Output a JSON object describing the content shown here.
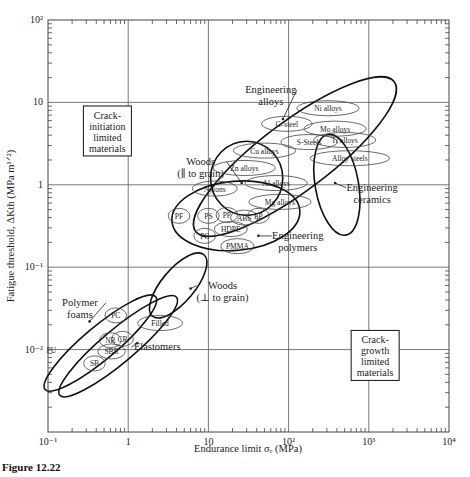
{
  "figure_caption": "Figure 12.22",
  "chart_data": {
    "type": "scatter",
    "title": "",
    "xlabel": "Endurance limit σe (MPa)",
    "ylabel": "Fatigue threshold, ΔKth (MPa m^1/2)",
    "xscale": "log",
    "yscale": "log",
    "xlim": [
      0.1,
      10000
    ],
    "ylim": [
      0.001,
      100
    ],
    "grid": "major decades",
    "x_ticks": [
      {
        "value": 0.1,
        "label": "10⁻¹"
      },
      {
        "value": 1,
        "label": "1"
      },
      {
        "value": 10,
        "label": "10"
      },
      {
        "value": 100,
        "label": "10²"
      },
      {
        "value": 1000,
        "label": "10³"
      },
      {
        "value": 10000,
        "label": "10⁴"
      }
    ],
    "y_ticks": [
      {
        "value": 100,
        "label": "10²"
      },
      {
        "value": 10,
        "label": "10"
      },
      {
        "value": 1,
        "label": "1"
      },
      {
        "value": 0.1,
        "label": "10⁻¹"
      },
      {
        "value": 0.01,
        "label": "10⁻²"
      }
    ],
    "boxed_annotations": [
      {
        "lines": [
          "Crack-",
          "initiation",
          "limited",
          "materials"
        ],
        "x": 0.55,
        "y": 4.5
      },
      {
        "lines": [
          "Crack-",
          "growth",
          "limited",
          "materials"
        ],
        "x": 1200,
        "y": 0.0085
      }
    ],
    "families": [
      {
        "name": "Engineering alloys",
        "label_lines": [
          "Engineering",
          "alloys"
        ],
        "cx": 120,
        "cy": 2.2,
        "rx_dec": 1.55,
        "ry_dec": 0.42,
        "angle": -37,
        "label_x": 60,
        "label_y": 13,
        "pointer": [
          85,
          6.3
        ],
        "bold": true
      },
      {
        "name": "Engineering ceramics",
        "label_lines": [
          "Engineering",
          "ceramics"
        ],
        "cx": 400,
        "cy": 1.0,
        "rx_dec": 0.27,
        "ry_dec": 0.62,
        "angle": -10,
        "label_x": 1100,
        "label_y": 0.85,
        "pointer": [
          380,
          1.05
        ],
        "bold": true
      },
      {
        "name": "Woods (∥ to grain)",
        "label_lines": [
          "Woods",
          "(∥ to grain)"
        ],
        "cx": 30,
        "cy": 1.2,
        "rx_dec": 0.45,
        "ry_dec": 0.45,
        "angle": 0,
        "label_x": 8,
        "label_y": 1.75,
        "pointer": [
          26,
          1.05
        ],
        "bold": true
      },
      {
        "name": "Engineering polymers",
        "label_lines": [
          "Engineering",
          "polymers"
        ],
        "cx": 22,
        "cy": 0.42,
        "rx_dec": 0.8,
        "ry_dec": 0.42,
        "angle": -5,
        "label_x": 130,
        "label_y": 0.22,
        "pointer": [
          42,
          0.24
        ],
        "bold": true
      },
      {
        "name": "Woods (⊥ to grain)",
        "label_lines": [
          "Woods",
          "(⊥ to grain)"
        ],
        "cx": 4.2,
        "cy": 0.06,
        "rx_dec": 0.5,
        "ry_dec": 0.2,
        "angle": -50,
        "label_x": 15,
        "label_y": 0.055,
        "pointer": [
          6,
          0.055
        ],
        "bold": true
      },
      {
        "name": "Polymer foams",
        "label_lines": [
          "Polymer",
          "foams"
        ],
        "cx": 0.45,
        "cy": 0.012,
        "rx_dec": 0.9,
        "ry_dec": 0.2,
        "angle": -40,
        "label_x": 0.25,
        "label_y": 0.034,
        "pointer": [
          0.33,
          0.022
        ],
        "bold": true
      },
      {
        "name": "Elastomers",
        "label_lines": [
          "Elastomers"
        ],
        "cx": 0.75,
        "cy": 0.011,
        "rx_dec": 0.95,
        "ry_dec": 0.2,
        "angle": -40,
        "label_x": 2.3,
        "label_y": 0.0098,
        "pointer": [
          1.3,
          0.012
        ],
        "bold": true
      }
    ],
    "materials": [
      {
        "name": "Ni alloys",
        "x": 310,
        "y": 8.5
      },
      {
        "name": "C–steel",
        "x": 95,
        "y": 5.5
      },
      {
        "name": "Mo alloys",
        "x": 380,
        "y": 4.8
      },
      {
        "name": "S-Steels",
        "x": 180,
        "y": 3.3
      },
      {
        "name": "Ti alloys",
        "x": 500,
        "y": 3.5
      },
      {
        "name": "Alloy steels",
        "x": 580,
        "y": 2.1
      },
      {
        "name": "Cu alloys",
        "x": 50,
        "y": 2.6
      },
      {
        "name": "Zn alloys",
        "x": 28,
        "y": 1.6
      },
      {
        "name": "Al alloys",
        "x": 70,
        "y": 1.05
      },
      {
        "name": "Mg alloys",
        "x": 78,
        "y": 0.62
      },
      {
        "name": "Nylons",
        "x": 12,
        "y": 0.9
      },
      {
        "name": "PF",
        "x": 4.3,
        "y": 0.42
      },
      {
        "name": "PS",
        "x": 10,
        "y": 0.42
      },
      {
        "name": "PP",
        "x": 17,
        "y": 0.43
      },
      {
        "name": "ABS",
        "x": 28,
        "y": 0.4
      },
      {
        "name": "EP",
        "x": 42,
        "y": 0.42
      },
      {
        "name": "HDPE",
        "x": 19,
        "y": 0.29
      },
      {
        "name": "PC",
        "x": 9,
        "y": 0.24
      },
      {
        "name": "PMMA",
        "x": 23,
        "y": 0.18
      },
      {
        "name": "PC",
        "x": 0.7,
        "y": 0.026
      },
      {
        "name": "Filled",
        "x": 2.5,
        "y": 0.021
      },
      {
        "name": "NR",
        "x": 0.6,
        "y": 0.013
      },
      {
        "name": "CR",
        "x": 0.85,
        "y": 0.0135
      },
      {
        "name": "SBR",
        "x": 0.62,
        "y": 0.0095
      },
      {
        "name": "SB",
        "x": 0.38,
        "y": 0.0068
      },
      {
        "name": "PU",
        "x": 0.11,
        "y": 0.01
      }
    ]
  }
}
